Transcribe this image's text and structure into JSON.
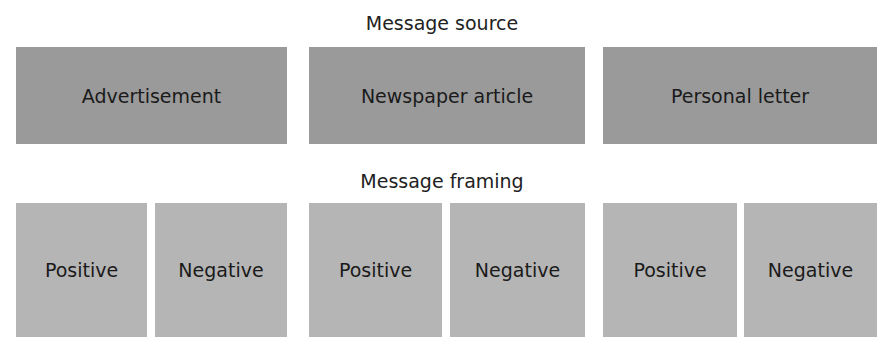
{
  "diagram": {
    "source_heading": "Message source",
    "framing_heading": "Message framing",
    "sources": [
      {
        "label": "Advertisement"
      },
      {
        "label": "Newspaper article"
      },
      {
        "label": "Personal letter"
      }
    ],
    "framings": [
      {
        "label": "Positive"
      },
      {
        "label": "Negative"
      },
      {
        "label": "Positive"
      },
      {
        "label": "Negative"
      },
      {
        "label": "Positive"
      },
      {
        "label": "Negative"
      }
    ],
    "colors": {
      "source_box": "#9a9a9a",
      "framing_box": "#b5b5b5",
      "text": "#1a1a1a"
    }
  }
}
